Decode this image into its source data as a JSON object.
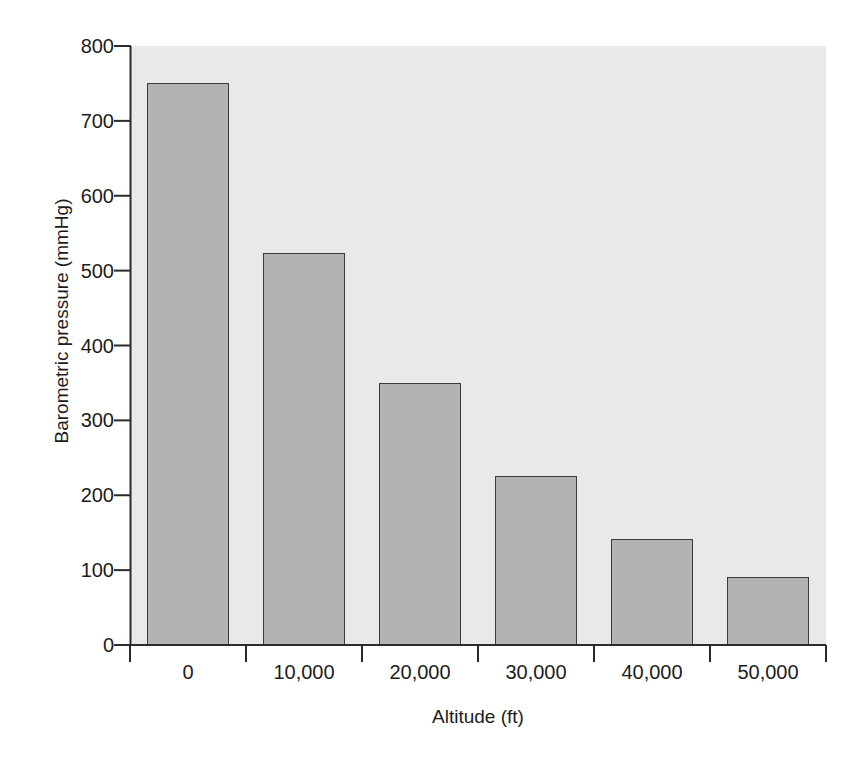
{
  "page": {
    "scan_artifact_line": "",
    "background_color": "#ffffff"
  },
  "chart_data": {
    "type": "bar",
    "title": "",
    "subtitle": "",
    "xlabel": "Altitude (ft)",
    "ylabel": "Barometric pressure (mmHg)",
    "categories": [
      "0",
      "10,000",
      "20,000",
      "30,000",
      "40,000",
      "50,000"
    ],
    "category_values": [
      0,
      10000,
      20000,
      30000,
      40000,
      50000
    ],
    "values": [
      751,
      523,
      350,
      226,
      141,
      91
    ],
    "series": [
      {
        "name": "Barometric pressure",
        "values": [
          751,
          523,
          350,
          226,
          141,
          91
        ]
      }
    ],
    "ylim": [
      0,
      800
    ],
    "ytick_labels": [
      "800",
      "700",
      "600",
      "500",
      "400",
      "300",
      "200",
      "100",
      "0"
    ],
    "ytick_values": [
      800,
      700,
      600,
      500,
      400,
      300,
      200,
      100,
      0
    ],
    "ytick_step": 100,
    "xtick_labels": [
      "0",
      "10,000",
      "20,000",
      "30,000",
      "40,000",
      "50,000"
    ],
    "grid": false,
    "legend": null,
    "legend_position": "none",
    "annotations": [],
    "colors": {
      "bar_fill": "#b2b2b2",
      "bar_edge": "#3b3b3b",
      "plot_background": "#e9e9e9",
      "axis": "#2b2b2b",
      "text": "#1c1c1c",
      "page_background": "#ffffff"
    }
  }
}
